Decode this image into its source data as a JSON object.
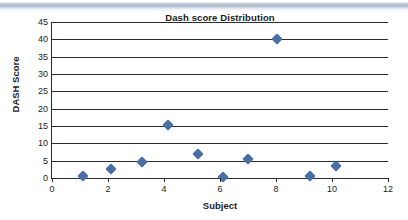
{
  "chart_data": {
    "type": "scatter",
    "title": "Dash score Distribution",
    "xlabel": "Subject",
    "ylabel": "DASH Score",
    "xlim": [
      0,
      12
    ],
    "ylim": [
      0,
      45
    ],
    "xticks": [
      0,
      2,
      4,
      6,
      8,
      10,
      12
    ],
    "yticks": [
      0,
      5,
      10,
      15,
      20,
      25,
      30,
      35,
      40,
      45
    ],
    "grid": "horizontal",
    "legend": "none",
    "marker": "diamond",
    "marker_color": "#4A6FA5",
    "series": [
      {
        "name": "DASH Score",
        "points": [
          {
            "x": 1.1,
            "y": 0.5
          },
          {
            "x": 2.1,
            "y": 2.7
          },
          {
            "x": 3.2,
            "y": 4.5
          },
          {
            "x": 4.15,
            "y": 15.3
          },
          {
            "x": 5.2,
            "y": 7.0
          },
          {
            "x": 6.1,
            "y": 0.4
          },
          {
            "x": 7.0,
            "y": 5.6
          },
          {
            "x": 8.05,
            "y": 40.0
          },
          {
            "x": 9.2,
            "y": 0.5
          },
          {
            "x": 10.15,
            "y": 3.6
          }
        ]
      }
    ]
  },
  "style": {
    "axis_color": "#2B2B2B",
    "text_color": "#1A1A1A",
    "band_color": "#B4BFD1",
    "background": "#FFFFFF"
  }
}
